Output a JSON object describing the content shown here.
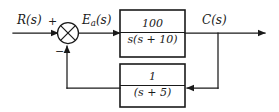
{
  "diagram": {
    "type": "control-system-block-diagram",
    "line_color": "#1a1a1a",
    "background": "#ffffff",
    "signals": {
      "input": "R(s)",
      "error": "E",
      "error_subscript": "a",
      "error_suffix": "(s)",
      "output": "C(s)"
    },
    "summing_junction": {
      "name": "summing-junction",
      "marker": "circle-with-x-cross",
      "input_sign": "+",
      "feedback_sign": "−"
    },
    "blocks": [
      {
        "id": "forward-block",
        "numerator": "100",
        "denominator": "s(s + 10)",
        "transfer_function": "100/(s(s+10))"
      },
      {
        "id": "feedback-block",
        "numerator": "1",
        "denominator": "(s + 5)",
        "transfer_function": "1/(s+5)"
      }
    ],
    "takeoff_point": {
      "name": "output-takeoff-point",
      "label": "C(s)"
    }
  }
}
